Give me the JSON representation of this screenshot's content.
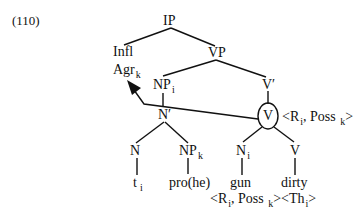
{
  "example_number": "(110)",
  "tree": {
    "root": "IP",
    "infl": "Infl",
    "agr": {
      "label": "Agr",
      "sub": "k"
    },
    "vp": "VP",
    "np_i": {
      "label": "NP",
      "sub": "i"
    },
    "v_bar": "V′",
    "n_bar": "N′",
    "v_head": "V",
    "v_head_grid": {
      "open": "<R",
      "sub1": "i",
      "mid": ", Poss ",
      "sub2": "k",
      "close": ">"
    },
    "n": "N",
    "np_k": {
      "label": "NP",
      "sub": "k"
    },
    "n_i": {
      "label": "N",
      "sub": "i"
    },
    "v": "V",
    "trace": {
      "label": "t",
      "sub": "i"
    },
    "pro": "pro(he)",
    "gun": "gun",
    "dirty": "dirty",
    "bottom_grid": {
      "open": "<R",
      "sub1": "i",
      "mid": ", Poss ",
      "sub2": "k",
      "mid2": "><Th",
      "sub3": "i",
      "close": ">"
    }
  }
}
